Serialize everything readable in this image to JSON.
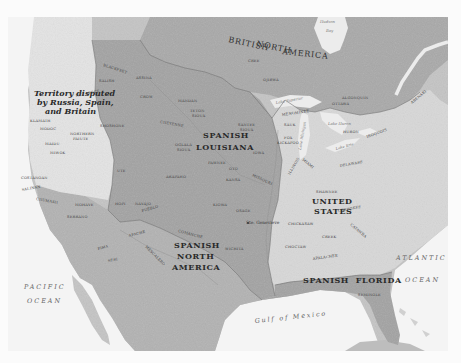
{
  "map": {
    "colors": {
      "background": "#fbfbfb",
      "ocean": "#f4f4f4",
      "spanish_territory": "#a6a6a6",
      "british_territory": "#a9a9a9",
      "united_states": "#d9d9d9",
      "disputed_territory": "#e6e6e6",
      "spanish_north_america": "#c2c2c2",
      "boundary": "#6e6e6e"
    },
    "regions": {
      "british_north_america": "BRITISH NORTH AMERICA",
      "british": "BRITISH",
      "north": "NORTH",
      "america": "AMERICA",
      "spanish_louisiana_1": "SPANISH",
      "spanish_louisiana_2": "LOUISIANA",
      "spanish_na_1": "SPANISH",
      "spanish_na_2": "NORTH",
      "spanish_na_3": "AMERICA",
      "united_states_1": "UNITED",
      "united_states_2": "STATES",
      "spanish_florida": "SPANISH  FLORIDA",
      "disputed_1": "Territory disputed",
      "disputed_2": "by Russia, Spain,",
      "disputed_3": "and Britain"
    },
    "water_bodies": {
      "hudson_1": "Hudson",
      "hudson_2": "Bay",
      "pacific_1": "PACIFIC",
      "pacific_2": "OCEAN",
      "atlantic_1": "ATLANTIC",
      "atlantic_2": "OCEAN",
      "gulf": "Gulf of Mexico",
      "lake_superior": "Lake Superior",
      "lake_michigan": "Lake Michigan",
      "lake_huron": "Lake Huron",
      "lake_erie": "Lake Erie"
    },
    "cities": {
      "ste_genevieve": "Ste. Genevieve"
    },
    "tribes": [
      {
        "id": "blackfeet",
        "label": "BLACKFEET"
      },
      {
        "id": "salish",
        "label": "SALISH"
      },
      {
        "id": "nez_perce",
        "label": "NEZ PERCE"
      },
      {
        "id": "klamath",
        "label": "KLAMATH"
      },
      {
        "id": "modoc",
        "label": "MODOC"
      },
      {
        "id": "shoshone",
        "label": "SHOSHONE"
      },
      {
        "id": "northern_paiute",
        "label": "NORTHERN PAIUTE"
      },
      {
        "id": "maidu",
        "label": "MAIDU"
      },
      {
        "id": "miwok",
        "label": "MIWOK"
      },
      {
        "id": "costanoan",
        "label": "COSTANOAN"
      },
      {
        "id": "salinan",
        "label": "SALINAN"
      },
      {
        "id": "chumash",
        "label": "CHUMASH"
      },
      {
        "id": "mohave",
        "label": "MOHAVE"
      },
      {
        "id": "serrano",
        "label": "SERRANO"
      },
      {
        "id": "ute",
        "label": "UTE"
      },
      {
        "id": "hopi",
        "label": "HOPI"
      },
      {
        "id": "navajo",
        "label": "NAVAJO"
      },
      {
        "id": "pueblo",
        "label": "PUEBLO"
      },
      {
        "id": "pima",
        "label": "PIMA"
      },
      {
        "id": "apache",
        "label": "APACHE"
      },
      {
        "id": "seri",
        "label": "SERI"
      },
      {
        "id": "mescalero",
        "label": "MESCALERO"
      },
      {
        "id": "assina",
        "label": "ASSINA"
      },
      {
        "id": "crow",
        "label": "CROW"
      },
      {
        "id": "mandan",
        "label": "MANDAN"
      },
      {
        "id": "teton_sioux",
        "label": "TETON SIOUX"
      },
      {
        "id": "cheyenne",
        "label": "CHEYENNE"
      },
      {
        "id": "santee_sioux",
        "label": "SANTEE SIOUX"
      },
      {
        "id": "oglala_sioux",
        "label": "OGLALA SIOUX"
      },
      {
        "id": "arapaho",
        "label": "ARAPAHO"
      },
      {
        "id": "pawnee",
        "label": "PAWNEE"
      },
      {
        "id": "oto",
        "label": "OTO"
      },
      {
        "id": "iowa",
        "label": "IOWA"
      },
      {
        "id": "kansa",
        "label": "KANSA"
      },
      {
        "id": "missouri",
        "label": "MISSOURI"
      },
      {
        "id": "kiowa",
        "label": "KIOWA"
      },
      {
        "id": "osage",
        "label": "OSAGE"
      },
      {
        "id": "comanche",
        "label": "COMANCHE"
      },
      {
        "id": "wichita",
        "label": "WICHITA"
      },
      {
        "id": "cree",
        "label": "CREE"
      },
      {
        "id": "ojibwa",
        "label": "OJIBWA"
      },
      {
        "id": "algonquin",
        "label": "ALGONQUIN"
      },
      {
        "id": "ottawa",
        "label": "OTTAWA"
      },
      {
        "id": "menominee",
        "label": "MENOMINEE"
      },
      {
        "id": "sauk",
        "label": "SAUK"
      },
      {
        "id": "fox",
        "label": "FOX"
      },
      {
        "id": "kickapoo",
        "label": "KICKAPOO"
      },
      {
        "id": "illinois",
        "label": "ILLINOIS"
      },
      {
        "id": "miami",
        "label": "MIAMI"
      },
      {
        "id": "huron",
        "label": "HURON"
      },
      {
        "id": "iroquois",
        "label": "IROQUOIS"
      },
      {
        "id": "delaware",
        "label": "DELAWARE"
      },
      {
        "id": "shawnee",
        "label": "SHAWNEE"
      },
      {
        "id": "cherokee",
        "label": "CHEROKEE"
      },
      {
        "id": "chickasaw",
        "label": "CHICKASAW"
      },
      {
        "id": "choctaw",
        "label": "CHOCTAW"
      },
      {
        "id": "creek",
        "label": "CREEK"
      },
      {
        "id": "catawba",
        "label": "CATAWBA"
      },
      {
        "id": "apalachee",
        "label": "APALACHEE"
      },
      {
        "id": "seminole",
        "label": "SEMINOLE"
      },
      {
        "id": "abenaki",
        "label": "ABENAKI"
      }
    ]
  }
}
